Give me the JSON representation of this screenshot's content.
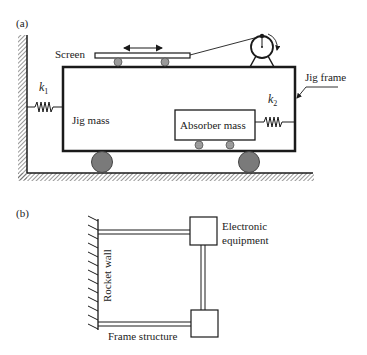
{
  "diagram_a": {
    "panel_label": "(a)",
    "screen_label": "Screen",
    "k1_label": "k",
    "k1_sub": "1",
    "k2_label": "k",
    "k2_sub": "2",
    "jig_mass_label": "Jig mass",
    "absorber_mass_label": "Absorber mass",
    "jig_frame_label": "Jig frame",
    "components": [
      "left-wall",
      "ground",
      "jig-frame",
      "screen",
      "screen-rollers",
      "double-arrow",
      "motor",
      "cable",
      "spring-k1",
      "absorber-mass",
      "absorber-rollers",
      "spring-k2",
      "wheels"
    ]
  },
  "diagram_b": {
    "panel_label": "(b)",
    "rocket_wall_label": "Rocket wall",
    "electronic_line1": "Electronic",
    "electronic_line2": "equipment",
    "frame_structure_label": "Frame structure",
    "components": [
      "rocket-wall",
      "upper-beam",
      "electronic-box",
      "vertical-beam",
      "lower-box",
      "lower-beam"
    ]
  },
  "colors": {
    "line": "#1a1a1a",
    "wheel_fill": "#7a7a7a",
    "roller_fill": "#9a9a9a",
    "hatch": "#555555"
  }
}
